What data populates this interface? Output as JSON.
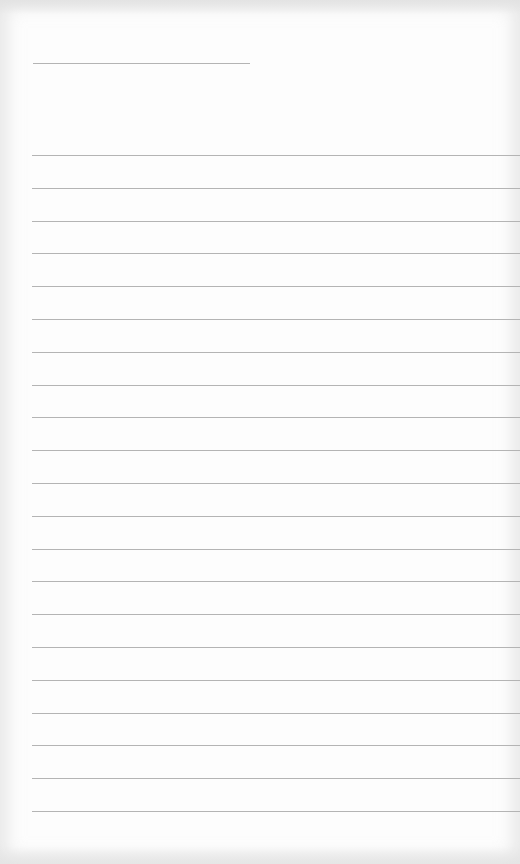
{
  "document": {
    "type": "lined-paper",
    "background_color": "#fdfdfd",
    "line_color": "#b4b4b4",
    "header_line": {
      "x": 33,
      "y": 63,
      "width": 217
    },
    "rules": {
      "count": 21,
      "start_y": 155,
      "spacing": 32.8,
      "left": 32
    }
  }
}
